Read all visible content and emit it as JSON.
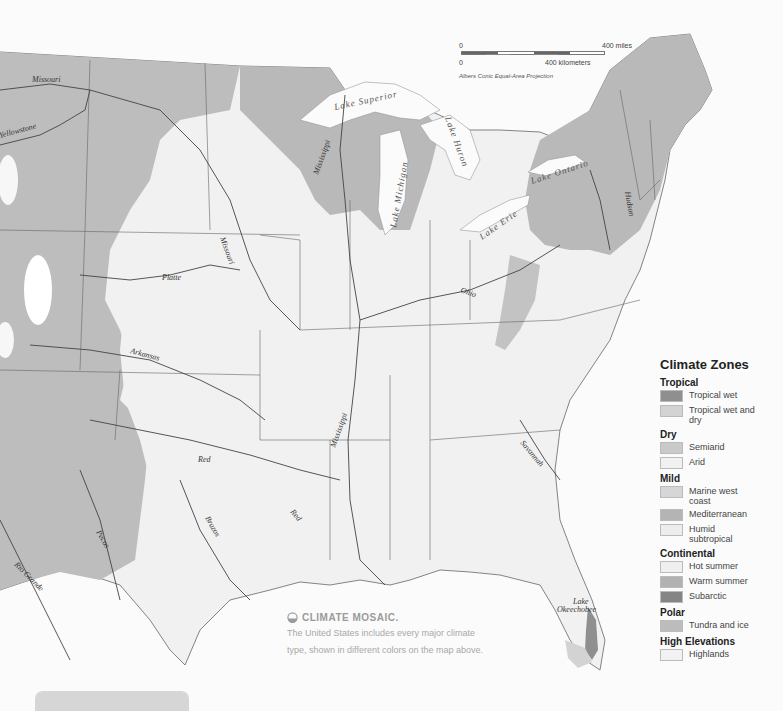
{
  "map": {
    "colors": {
      "background": "#fbfbfb",
      "land_light": "#f1f1f1",
      "zone_dark": "#b9b9b9",
      "zone_mid": "#cfcfcf",
      "zone_subarctic": "#8a8a8a",
      "water": "#fbfbfb",
      "border": "#555555"
    },
    "rivers": {
      "missouri_north": "Missouri",
      "yellowstone": "Yellowstone",
      "missouri_central": "Missouri",
      "platte": "Platte",
      "arkansas": "Arkansas",
      "red_north": "Red",
      "red_south": "Red",
      "mississippi_north": "Mississippi",
      "mississippi_south": "Mississippi",
      "ohio": "Ohio",
      "hudson": "Hudson",
      "savannah": "Savannah",
      "rio_grande": "Rio Grande",
      "pecos": "Pecos",
      "brazos": "Brazos"
    },
    "lakes": {
      "superior": "Lake Superior",
      "michigan": "Lake Michigan",
      "huron": "Lake Huron",
      "erie": "Lake Erie",
      "ontario": "Lake Ontario",
      "okeechobee_1": "Lake",
      "okeechobee_2": "Okeechobee"
    }
  },
  "scale_bar": {
    "miles_zero": "0",
    "miles_label": "400 miles",
    "km_zero": "0",
    "km_label": "400 kilometers",
    "projection": "Albers Conic Equal-Area Projection"
  },
  "legend": {
    "title": "Climate Zones",
    "groups": [
      {
        "name": "Tropical",
        "items": [
          {
            "label": "Tropical wet",
            "color": "#8f8f8f"
          },
          {
            "label": "Tropical wet and dry",
            "color": "#d3d3d3"
          }
        ]
      },
      {
        "name": "Dry",
        "items": [
          {
            "label": "Semiarid",
            "color": "#cacaca"
          },
          {
            "label": "Arid",
            "color": "#f1f1f1"
          }
        ]
      },
      {
        "name": "Mild",
        "items": [
          {
            "label": "Marine west coast",
            "color": "#d6d6d6"
          },
          {
            "label": "Mediterranean",
            "color": "#b4b4b4"
          },
          {
            "label": "Humid subtropical",
            "color": "#ededed"
          }
        ]
      },
      {
        "name": "Continental",
        "items": [
          {
            "label": "Hot summer",
            "color": "#efefef"
          },
          {
            "label": "Warm summer",
            "color": "#b2b2b2"
          },
          {
            "label": "Subarctic",
            "color": "#858585"
          }
        ]
      },
      {
        "name": "Polar",
        "items": [
          {
            "label": "Tundra and ice",
            "color": "#bdbdbd"
          }
        ]
      },
      {
        "name": "High Elevations",
        "items": [
          {
            "label": "Highlands",
            "color": "#f2f2f2"
          }
        ]
      }
    ]
  },
  "caption": {
    "icon": "globe-half-icon",
    "heading": "CLIMATE MOSAIC.",
    "line1": "The United States includes every major climate",
    "line2": "type, shown in different colors on the map above."
  }
}
